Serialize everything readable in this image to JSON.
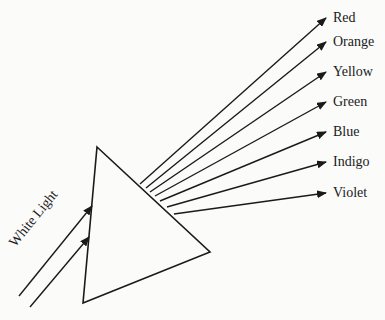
{
  "diagram": {
    "incoming_label": "White Light",
    "prism": {
      "vertices": [
        [
          97,
          147
        ],
        [
          210,
          252
        ],
        [
          83,
          303
        ]
      ]
    },
    "incoming_rays": [
      {
        "from": [
          19,
          296
        ],
        "to": [
          92,
          206
        ]
      },
      {
        "from": [
          30,
          307
        ],
        "to": [
          89,
          237
        ]
      }
    ],
    "spectrum": [
      {
        "label": "Red",
        "from": [
          140,
          184
        ],
        "to": [
          326,
          18
        ],
        "label_pos": [
          333,
          11
        ]
      },
      {
        "label": "Orange",
        "from": [
          146,
          188
        ],
        "to": [
          326,
          42
        ],
        "label_pos": [
          333,
          35
        ]
      },
      {
        "label": "Yellow",
        "from": [
          150,
          192
        ],
        "to": [
          326,
          72
        ],
        "label_pos": [
          333,
          65
        ]
      },
      {
        "label": "Green",
        "from": [
          155,
          196
        ],
        "to": [
          326,
          102
        ],
        "label_pos": [
          333,
          95
        ]
      },
      {
        "label": "Blue",
        "from": [
          160,
          201
        ],
        "to": [
          326,
          132
        ],
        "label_pos": [
          333,
          125
        ]
      },
      {
        "label": "Indigo",
        "from": [
          167,
          207
        ],
        "to": [
          326,
          162
        ],
        "label_pos": [
          333,
          155
        ]
      },
      {
        "label": "Violet",
        "from": [
          174,
          214
        ],
        "to": [
          326,
          193
        ],
        "label_pos": [
          333,
          186
        ]
      }
    ],
    "colors": {
      "stroke": "#1a1a1a",
      "background": "#fbfbfa"
    }
  }
}
